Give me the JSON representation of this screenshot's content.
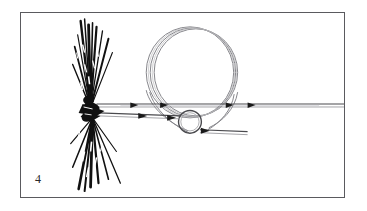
{
  "figure": {
    "step_number": "4",
    "caption": "",
    "border_color": "#5a5a5e",
    "background_color": "#ffffff",
    "ink_color": "#1a1a1a",
    "strand_color": "#6e6e72",
    "illustration": {
      "subject": "fly-tying knot step diagram",
      "elements": [
        "hackle-fiber-fly",
        "large-line-loop",
        "small-hook-eye-circle",
        "tippet-line",
        "tag-end-line"
      ]
    }
  },
  "geometry": {
    "frame": {
      "x": 20,
      "y": 12,
      "width": 325,
      "height": 186
    },
    "knot_head": {
      "cx": 88,
      "cy": 108
    },
    "large_loop": {
      "cx": 190,
      "cy": 72,
      "rx": 43,
      "ry": 45,
      "strands": 3
    },
    "small_circle": {
      "cx": 190,
      "cy": 122,
      "r": 11
    },
    "tippet_line": {
      "x1": 96,
      "y1": 105,
      "x2": 344,
      "y2": 105
    },
    "tag_end_line": {
      "x1": 96,
      "y1": 114,
      "x2": 248,
      "y2": 133
    }
  }
}
